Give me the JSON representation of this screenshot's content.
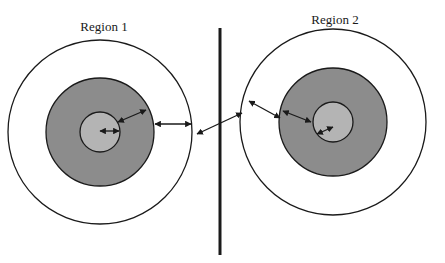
{
  "diagram": {
    "regions": [
      {
        "label": "Region 1",
        "label_pos": [
          104,
          31
        ],
        "center": [
          100,
          132
        ],
        "outer_radius": 92,
        "middle_radius": 54,
        "inner_radius": 20
      },
      {
        "label": "Region 2",
        "label_pos": [
          335,
          24
        ],
        "center": [
          333,
          122
        ],
        "outer_radius": 93,
        "middle_radius": 54,
        "inner_radius": 20
      }
    ],
    "divider": {
      "x": 220,
      "y1": 28,
      "y2": 255
    },
    "colors": {
      "background": "#ffffff",
      "outer_fill": "#ffffff",
      "middle_fill": "#8c8c8c",
      "inner_fill": "#b4b4b4",
      "stroke": "#1a1a1a"
    },
    "arrows": [
      {
        "from": [
          100,
          131
        ],
        "to": [
          119,
          131
        ],
        "note": "region 1 inner radius"
      },
      {
        "from": [
          118,
          122
        ],
        "to": [
          146,
          110
        ],
        "note": "region 1 inner to middle"
      },
      {
        "from": [
          155,
          124
        ],
        "to": [
          191,
          124
        ],
        "note": "region 1 middle to outer"
      },
      {
        "from": [
          197,
          134
        ],
        "to": [
          242,
          113
        ],
        "note": "between regions across divider"
      },
      {
        "from": [
          249,
          101
        ],
        "to": [
          280,
          118
        ],
        "note": "region 2 outer to middle"
      },
      {
        "from": [
          283,
          111
        ],
        "to": [
          311,
          122
        ],
        "note": "region 2 middle to inner"
      },
      {
        "from": [
          317,
          134
        ],
        "to": [
          333,
          127
        ],
        "note": "region 2 inner radius"
      }
    ]
  }
}
